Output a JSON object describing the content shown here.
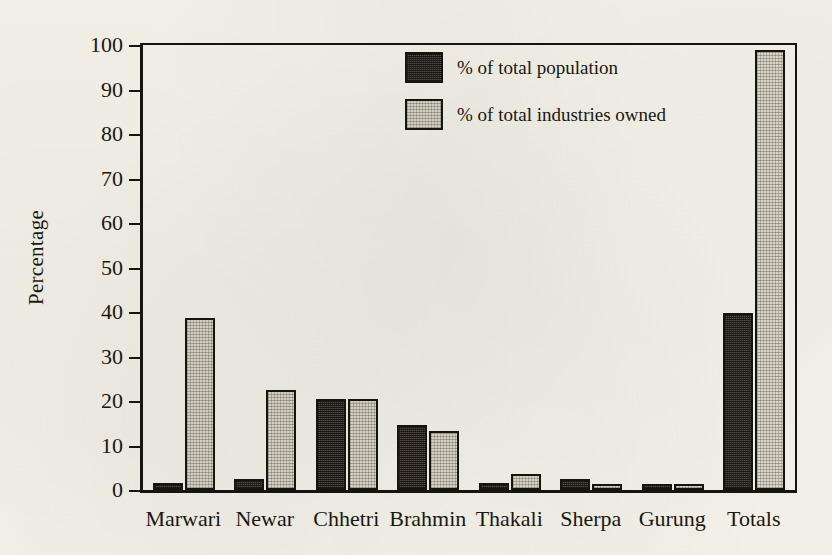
{
  "chart_data": {
    "type": "bar",
    "title": "",
    "xlabel": "",
    "ylabel": "Percentage",
    "ylim": [
      0,
      100
    ],
    "ytick_labels": [
      "0",
      "10",
      "20",
      "30",
      "40",
      "50",
      "60",
      "70",
      "80",
      "90",
      "100"
    ],
    "yticks": [
      0,
      10,
      20,
      30,
      40,
      50,
      60,
      70,
      80,
      90,
      100
    ],
    "grid": false,
    "legend_position": "top-right",
    "categories": [
      "Marwari",
      "Newar",
      "Chhetri",
      "Brahmin",
      "Thakali",
      "Sherpa",
      "Gurung",
      "Totals"
    ],
    "series": [
      {
        "name": "% of total population",
        "color": "#565048",
        "values": [
          1.6,
          2.5,
          20.5,
          14.6,
          1.6,
          2.5,
          1.3,
          39.8
        ]
      },
      {
        "name": "% of total industries owned",
        "color": "#dedacd",
        "values": [
          38.6,
          22.5,
          20.5,
          13.3,
          3.7,
          1.3,
          1.3,
          98.8
        ]
      }
    ]
  },
  "legend": {
    "items": [
      {
        "label": "% of total population",
        "swatch": "dark"
      },
      {
        "label": "% of total industries owned",
        "swatch": "light"
      }
    ]
  }
}
